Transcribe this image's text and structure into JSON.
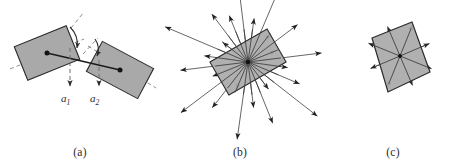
{
  "figure": {
    "width": 466,
    "height": 162,
    "background": "#ffffff"
  },
  "style": {
    "shape_fill": "#a9a9a9",
    "shape_stroke": "#2b2b2b",
    "arrow_color": "#2b2b2b",
    "dashed_color": "#8f8f8f",
    "solid_line_color": "#1a1a1a",
    "caption_color": "#2b2b2b"
  },
  "panels": [
    {
      "id": "a",
      "caption": "(a)",
      "description": "two shaded rectangles joined by a solid connecting segment, each with a dashed principal axis, a dashed downward arrow labeled with its direction vector, and an angle arc between the dashed axis and the connecting segment",
      "shapes": [
        {
          "name": "rectangle-left",
          "center": [
            47,
            53
          ],
          "width": 56,
          "height": 36,
          "rotation_deg": -22,
          "fill": "#a9a9a9",
          "stroke": "#2b2b2b",
          "center_dot": true
        },
        {
          "name": "rectangle-right",
          "center": [
            120,
            70
          ],
          "width": 58,
          "height": 34,
          "rotation_deg": 28,
          "fill": "#a9a9a9",
          "stroke": "#2b2b2b",
          "center_dot": true
        }
      ],
      "labels": [
        {
          "name": "direction-vector-a1",
          "text": "a",
          "sub": "1",
          "x": 45,
          "y": 98
        },
        {
          "name": "direction-vector-a2",
          "text": "a",
          "sub": "2",
          "x": 92,
          "y": 98
        }
      ]
    },
    {
      "id": "b",
      "caption": "(b)",
      "description": "a shaded rectangle with a dense radial fan of arrows of varying length emanating outward from its centre in all directions",
      "shapes": [
        {
          "name": "rectangle-center",
          "center": [
            88,
            62
          ],
          "width": 66,
          "height": 38,
          "rotation_deg": -30,
          "fill": "#a9a9a9",
          "stroke": "#2b2b2b",
          "center_dot": true
        }
      ],
      "arrow_count": 24,
      "arrow_lengths": [
        70,
        44,
        86,
        36,
        62,
        30,
        74,
        40,
        56,
        88,
        34,
        66,
        46,
        78,
        30,
        58,
        84,
        38,
        68,
        44,
        90,
        32,
        60,
        50
      ]
    },
    {
      "id": "c",
      "caption": "(c)",
      "description": "a shaded quadrilateral with eight short arrows radiating from its centre through the corners and edge midpoints",
      "shapes": [
        {
          "name": "quadrilateral-center",
          "points": "52,38 92,22 110,72 68,92",
          "fill": "#a9a9a9",
          "stroke": "#2b2b2b",
          "center_dot": true,
          "center": [
            80,
            56
          ]
        }
      ],
      "arrow_count": 8,
      "arrow_lengths": [
        34,
        32,
        34,
        32,
        34,
        32,
        34,
        32
      ]
    }
  ]
}
